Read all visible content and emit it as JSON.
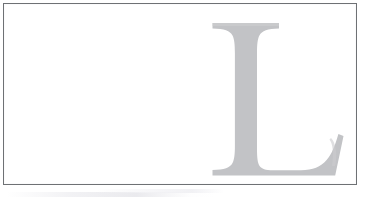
{
  "document": {
    "type": "scanned-page-fragment",
    "background_color": "#ffffff",
    "frame": {
      "border_color": "#6e7174",
      "border_width_px": 1,
      "fill_color": "#ffffff",
      "x": 3,
      "y": 3,
      "width": 354,
      "height": 182
    },
    "dropcap": {
      "character": "L",
      "style": "serif-drop-cap",
      "color": "#c2c3c6",
      "shadow_color": "#cfd0d2",
      "x": 212,
      "y": 22,
      "width": 128,
      "height": 154,
      "alt_text": "Large light gray serif capital letter L"
    },
    "artifact": {
      "label": "scanner-streak",
      "color": "#ecedef",
      "visible": true
    },
    "body_text": ""
  }
}
